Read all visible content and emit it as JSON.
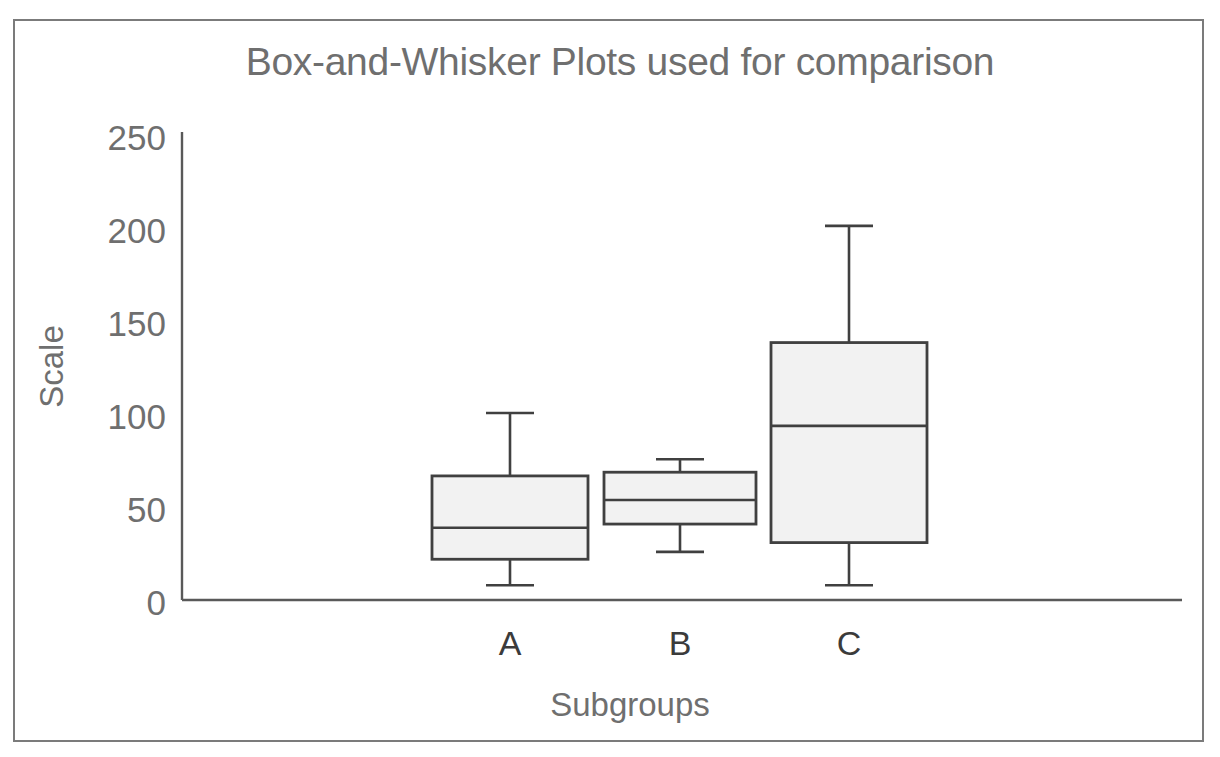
{
  "chart_data": {
    "type": "box",
    "title": "Box-and-Whisker Plots used for comparison",
    "xlabel": "Subgroups",
    "ylabel": "Scale",
    "categories": [
      "A",
      "B",
      "C"
    ],
    "ylim": [
      0,
      250
    ],
    "yticks": [
      "0",
      "50",
      "100",
      "150",
      "200",
      "250"
    ],
    "ytick_values": [
      0,
      50,
      100,
      150,
      200,
      250
    ],
    "grid": false,
    "legend": null,
    "boxes": [
      {
        "label": "A",
        "min": 8,
        "q1": 22,
        "median": 39,
        "q3": 67,
        "max": 101
      },
      {
        "label": "B",
        "min": 26,
        "q1": 41,
        "median": 54,
        "q3": 69,
        "max": 76
      },
      {
        "label": "C",
        "min": 8,
        "q1": 31,
        "median": 94,
        "q3": 139,
        "max": 202
      }
    ],
    "colors": {
      "box_fill": "#f2f2f2",
      "box_stroke": "#404040",
      "axis": "#595959",
      "title_text": "#6f6f6f",
      "tick_text": "#6f6f6f",
      "category_text": "#3b3b3b",
      "frame": "#7b7b7b",
      "background": "#ffffff"
    }
  }
}
